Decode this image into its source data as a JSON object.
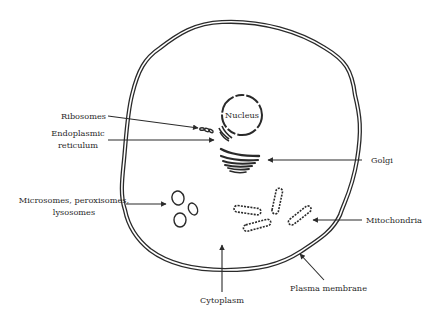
{
  "diagram": {
    "colors": {
      "stroke": "#2a2a2a",
      "background": "#ffffff"
    },
    "labels": {
      "nucleus": "Nucleus",
      "ribosomes": "Ribosomes",
      "er_line1": "Endoplasmic",
      "er_line2": "reticulum",
      "golgi": "Golgi",
      "micro_line1": "Microsomes, peroxisomes,",
      "micro_line2": "lysosomes",
      "mitochondria": "Mitochondria",
      "cytoplasm": "Cytoplasm",
      "plasma_membrane": "Plasma membrane"
    }
  }
}
